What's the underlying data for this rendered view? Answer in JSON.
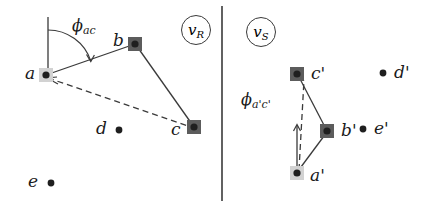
{
  "figure": {
    "type": "two-panel-geometry-diagram",
    "width": 440,
    "height": 207,
    "background": "#ffffff",
    "stroke_color": "#3a3a3a",
    "divider": {
      "x": 222,
      "y1": 6,
      "y2": 201
    }
  },
  "panels": [
    {
      "id": "left",
      "badge": {
        "base": "v",
        "sub": "R",
        "cx": 196,
        "cy": 30,
        "r": 15
      },
      "angle_label": {
        "base": "ϕ",
        "sub": "ac",
        "x": 72,
        "y": 25
      },
      "reference_line": {
        "x": 48,
        "y1": 17,
        "y2": 75
      },
      "arc": {
        "cx": 48,
        "cy": 75,
        "r": 45,
        "start_deg": -90,
        "end_deg": -18
      },
      "nodes": [
        {
          "id": "a",
          "label": "a",
          "x": 46,
          "y": 75,
          "style": "light-square",
          "label_dx": -17,
          "label_dy": -9
        },
        {
          "id": "b",
          "label": "b",
          "x": 135,
          "y": 44,
          "style": "dark-square",
          "label_dx": -20,
          "label_dy": -11
        },
        {
          "id": "c",
          "label": "c",
          "x": 194,
          "y": 127,
          "style": "dark-square",
          "label_dx": -21,
          "label_dy": -4
        },
        {
          "id": "d",
          "label": "d",
          "x": 119,
          "y": 130,
          "style": "dot",
          "label_dx": -22,
          "label_dy": -9
        },
        {
          "id": "e",
          "label": "e",
          "x": 51,
          "y": 183,
          "style": "dot",
          "label_dx": -22,
          "label_dy": -9
        }
      ],
      "solid_edges": [
        [
          "a",
          "b"
        ],
        [
          "b",
          "c"
        ]
      ],
      "dashed_edges": [
        [
          "a",
          "c"
        ]
      ]
    },
    {
      "id": "right",
      "badge": {
        "base": "v",
        "sub": "S",
        "cx": 261,
        "cy": 32,
        "r": 15
      },
      "angle_label": {
        "base": "ϕ",
        "sub": "a'c'",
        "x": 243,
        "y": 98
      },
      "reference_line": {
        "x": 297,
        "y1": 125,
        "y2": 173
      },
      "nodes": [
        {
          "id": "a'",
          "label": "a'",
          "x": 297,
          "y": 173,
          "style": "light-square",
          "label_dx": 13,
          "label_dy": -5
        },
        {
          "id": "b'",
          "label": "b'",
          "x": 327,
          "y": 131,
          "style": "dark-square",
          "label_dx": 14,
          "label_dy": -9
        },
        {
          "id": "c'",
          "label": "c'",
          "x": 297,
          "y": 74,
          "style": "dark-square",
          "label_dx": 14,
          "label_dy": -9
        },
        {
          "id": "d'",
          "label": "d'",
          "x": 383,
          "y": 73,
          "style": "dot",
          "label_dx": 11,
          "label_dy": -9
        },
        {
          "id": "e'",
          "label": "e'",
          "x": 363,
          "y": 129,
          "style": "dot",
          "label_dx": 11,
          "label_dy": -9
        }
      ],
      "solid_edges": [
        [
          "a'",
          "b'"
        ],
        [
          "b'",
          "c'"
        ]
      ],
      "dashed_edges": [
        [
          "a'",
          "c'"
        ]
      ]
    }
  ],
  "marker_styles": {
    "light-square": {
      "size": 14,
      "fill": "#d2d2d2",
      "dot_r": 3.6,
      "dot_fill": "#1f1f1f"
    },
    "dark-square": {
      "size": 14,
      "fill": "#5c5c5c",
      "dot_r": 3.6,
      "dot_fill": "#1f1f1f"
    },
    "dot": {
      "size": 0,
      "fill": "none",
      "dot_r": 3.4,
      "dot_fill": "#1f1f1f"
    }
  }
}
